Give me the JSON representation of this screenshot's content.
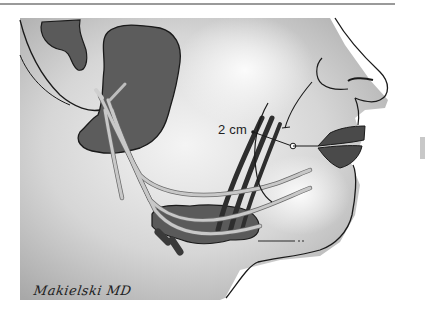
{
  "figure": {
    "annotations": {
      "distance_label": "2 cm"
    },
    "signature": "Makielski MD",
    "colors": {
      "background": "#ffffff",
      "skin_shading": "#c4c4c4",
      "gland": "#5a5a5a",
      "nerve": "#b8b8b8",
      "vessel": "#3a3a3a",
      "outline": "#1a1a1a",
      "lip": "#4a4a4a"
    }
  }
}
